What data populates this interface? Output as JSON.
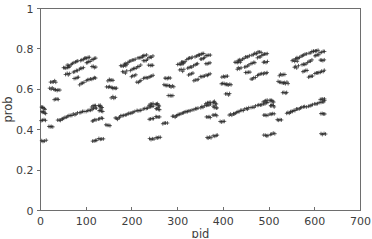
{
  "chart_data": {
    "type": "scatter",
    "title": "",
    "xlabel": "pid",
    "ylabel": "prob",
    "xlim": [
      0,
      700
    ],
    "ylim": [
      0,
      1
    ],
    "xticks": [
      0,
      100,
      200,
      300,
      400,
      500,
      600,
      700
    ],
    "yticks": [
      0,
      0.2,
      0.4,
      0.6,
      0.8,
      1
    ],
    "xtick_labels": [
      "0",
      "100",
      "200",
      "300",
      "400",
      "500",
      "600",
      "700"
    ],
    "ytick_labels": [
      "0",
      "0.2",
      "0.4",
      "0.6",
      "0.8",
      "1"
    ],
    "grid": false,
    "legend": null,
    "marker": "plus",
    "marker_color": "#2b2b2b",
    "period": 125,
    "blocks": 5,
    "series": [
      {
        "name": "prob",
        "points": [
          [
            2,
            0.51
          ],
          [
            4,
            0.508
          ],
          [
            6,
            0.512
          ],
          [
            8,
            0.505
          ],
          [
            10,
            0.5
          ],
          [
            3,
            0.488
          ],
          [
            5,
            0.486
          ],
          [
            7,
            0.492
          ],
          [
            9,
            0.484
          ],
          [
            11,
            0.48
          ],
          [
            2,
            0.446
          ],
          [
            5,
            0.444
          ],
          [
            8,
            0.448
          ],
          [
            11,
            0.445
          ],
          [
            3,
            0.345
          ],
          [
            6,
            0.344
          ],
          [
            9,
            0.346
          ],
          [
            12,
            0.345
          ],
          [
            18,
            0.415
          ],
          [
            21,
            0.414
          ],
          [
            24,
            0.416
          ],
          [
            27,
            0.413
          ],
          [
            20,
            0.603
          ],
          [
            23,
            0.601
          ],
          [
            26,
            0.604
          ],
          [
            29,
            0.6
          ],
          [
            32,
            0.598
          ],
          [
            22,
            0.636
          ],
          [
            25,
            0.638
          ],
          [
            28,
            0.634
          ],
          [
            31,
            0.64
          ],
          [
            34,
            0.637
          ],
          [
            33,
            0.598
          ],
          [
            36,
            0.596
          ],
          [
            39,
            0.599
          ],
          [
            42,
            0.597
          ],
          [
            30,
            0.551
          ],
          [
            33,
            0.553
          ],
          [
            36,
            0.549
          ],
          [
            39,
            0.552
          ],
          [
            38,
            0.447
          ],
          [
            41,
            0.449
          ],
          [
            44,
            0.446
          ],
          [
            47,
            0.452
          ],
          [
            48,
            0.455
          ],
          [
            51,
            0.458
          ],
          [
            54,
            0.461
          ],
          [
            57,
            0.463
          ],
          [
            50,
            0.706
          ],
          [
            53,
            0.708
          ],
          [
            56,
            0.704
          ],
          [
            59,
            0.71
          ],
          [
            62,
            0.707
          ],
          [
            58,
            0.718
          ],
          [
            61,
            0.72
          ],
          [
            64,
            0.717
          ],
          [
            67,
            0.722
          ],
          [
            55,
            0.676
          ],
          [
            58,
            0.679
          ],
          [
            61,
            0.674
          ],
          [
            64,
            0.681
          ],
          [
            60,
            0.466
          ],
          [
            63,
            0.468
          ],
          [
            66,
            0.47
          ],
          [
            69,
            0.472
          ],
          [
            70,
            0.73
          ],
          [
            73,
            0.733
          ],
          [
            76,
            0.736
          ],
          [
            79,
            0.738
          ],
          [
            82,
            0.741
          ],
          [
            72,
            0.686
          ],
          [
            75,
            0.689
          ],
          [
            78,
            0.692
          ],
          [
            81,
            0.694
          ],
          [
            74,
            0.655
          ],
          [
            77,
            0.657
          ],
          [
            80,
            0.66
          ],
          [
            83,
            0.662
          ],
          [
            72,
            0.475
          ],
          [
            75,
            0.477
          ],
          [
            78,
            0.479
          ],
          [
            81,
            0.481
          ],
          [
            85,
            0.7
          ],
          [
            88,
            0.703
          ],
          [
            91,
            0.706
          ],
          [
            94,
            0.709
          ],
          [
            88,
            0.744
          ],
          [
            91,
            0.747
          ],
          [
            94,
            0.75
          ],
          [
            97,
            0.752
          ],
          [
            86,
            0.625
          ],
          [
            89,
            0.628
          ],
          [
            92,
            0.631
          ],
          [
            95,
            0.633
          ],
          [
            86,
            0.484
          ],
          [
            89,
            0.486
          ],
          [
            92,
            0.488
          ],
          [
            95,
            0.49
          ],
          [
            98,
            0.755
          ],
          [
            101,
            0.757
          ],
          [
            104,
            0.758
          ],
          [
            107,
            0.76
          ],
          [
            100,
            0.733
          ],
          [
            103,
            0.735
          ],
          [
            106,
            0.737
          ],
          [
            109,
            0.739
          ],
          [
            100,
            0.645
          ],
          [
            103,
            0.646
          ],
          [
            106,
            0.648
          ],
          [
            109,
            0.65
          ],
          [
            100,
            0.493
          ],
          [
            103,
            0.495
          ],
          [
            106,
            0.497
          ],
          [
            109,
            0.499
          ],
          [
            112,
            0.748
          ],
          [
            115,
            0.75
          ],
          [
            118,
            0.752
          ],
          [
            121,
            0.754
          ],
          [
            112,
            0.71
          ],
          [
            115,
            0.712
          ],
          [
            118,
            0.709
          ],
          [
            121,
            0.713
          ],
          [
            112,
            0.652
          ],
          [
            115,
            0.654
          ],
          [
            118,
            0.656
          ],
          [
            121,
            0.658
          ],
          [
            112,
            0.513
          ],
          [
            115,
            0.516
          ],
          [
            118,
            0.519
          ],
          [
            121,
            0.521
          ],
          [
            113,
            0.502
          ],
          [
            116,
            0.504
          ],
          [
            119,
            0.506
          ],
          [
            122,
            0.508
          ],
          [
            113,
            0.445
          ],
          [
            116,
            0.444
          ],
          [
            119,
            0.447
          ],
          [
            122,
            0.446
          ],
          [
            114,
            0.345
          ],
          [
            117,
            0.344
          ],
          [
            120,
            0.346
          ],
          [
            123,
            0.345
          ]
        ]
      }
    ],
    "value_ranges": {
      "upper_cluster": [
        0.595,
        0.8
      ],
      "mid_cluster": [
        0.44,
        0.535
      ],
      "low_band": [
        0.344,
        0.347
      ],
      "pid_extent": [
        0,
        632
      ]
    }
  },
  "axes": {
    "x_axis_label": "pid",
    "y_axis_label": "prob"
  }
}
